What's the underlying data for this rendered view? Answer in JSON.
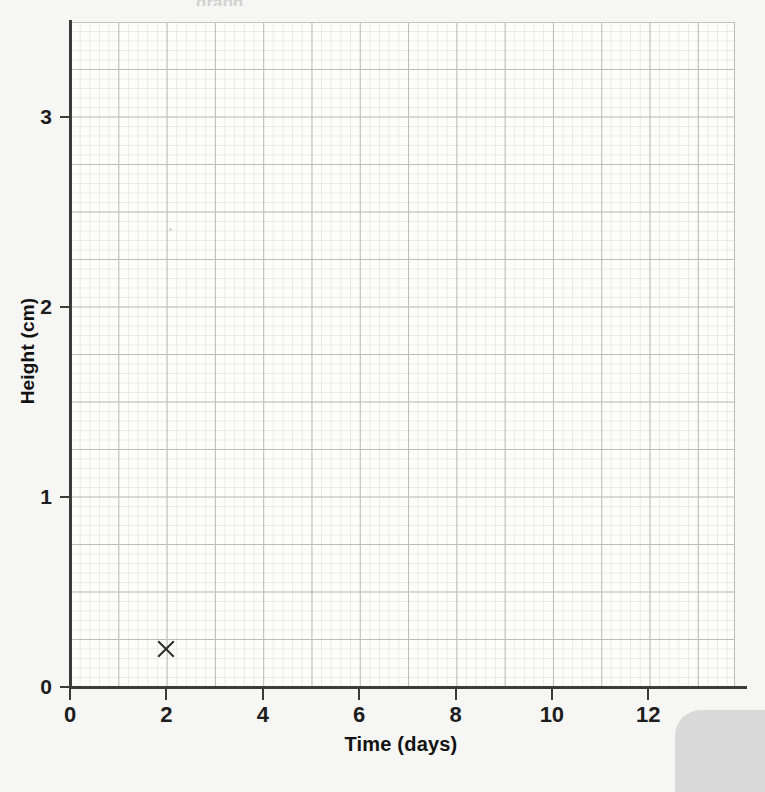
{
  "chart_data": {
    "type": "scatter",
    "title": "",
    "xlabel": "Time (days)",
    "ylabel": "Height (cm)",
    "xlim": [
      0,
      13.8
    ],
    "ylim": [
      0,
      3.5
    ],
    "xticks": [
      0,
      2,
      4,
      6,
      8,
      10,
      12
    ],
    "xtick_labels": [
      "0",
      "2",
      "4",
      "6",
      "8",
      "10",
      "12"
    ],
    "yticks": [
      0,
      1,
      2,
      3
    ],
    "ytick_labels": [
      "0",
      "1",
      "2",
      "3"
    ],
    "grid": true,
    "grid_major_step_x": 1,
    "grid_major_step_y": 0.25,
    "grid_minor_step_x": 0.2,
    "grid_minor_step_y": 0.05,
    "legend": null,
    "series": [
      {
        "name": "Plotted points",
        "marker": "x",
        "color": "#2c2c2c",
        "points": [
          {
            "x": 2,
            "y": 0.2
          }
        ]
      }
    ]
  },
  "axes": {
    "x_title": "Time (days)",
    "y_title": "Height (cm)"
  },
  "artifacts": {
    "top_cropped_text": "graph",
    "corner_color": "#d9d9d9"
  },
  "colors": {
    "background": "#f6f6f4",
    "plot_background": "#fdfdfc",
    "grid_major": "#bcbcbc",
    "grid_minor": "#e9e9e7",
    "axis": "#3b3b3b",
    "text": "#121212",
    "marker": "#2c2c2c"
  }
}
